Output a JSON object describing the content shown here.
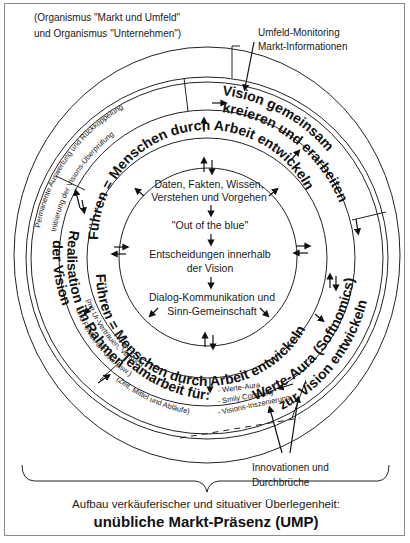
{
  "labels": {
    "top_left_line1": "(Organismus \"Markt und Umfeld\"",
    "top_left_line2": "und Organismus \"Unternehmen\")",
    "top_right_line1": "Umfeld-Monitoring",
    "top_right_line2": "Markt-Informationen",
    "bottom_right_line1": "Innovationen und",
    "bottom_right_line2": "Durchbrüche",
    "footer_line1": "Aufbau verkäuferischer und situativer Überlegenheit:",
    "footer_line2": "unübliche Markt-Präsenz (UMP)"
  },
  "outer_band": {
    "feedback_line1": "Permanente Auswertung und Rückkoppelung",
    "feedback_line2": "Initiierung der Visions-Überprüfung"
  },
  "sectors": {
    "vision_line1": "Vision gemeinsam",
    "vision_line2": "kreieren und erarbeiten",
    "werte_line1": "Werte-Aura (Softnomics)",
    "werte_line2": "zur Vision entwickeln",
    "team_title": "Teamarbeit für:",
    "team_sub": "(Zeit, Mittel und Abläufe)",
    "team_items": [
      "- Werte-Aura",
      "- Smily Company",
      "- Visions-Inszenierung"
    ],
    "realisation_line1": "Realisation im Rahmen",
    "realisation_line2": "der Vision",
    "realisation_sub1": "(mit Ur-Vertrauen, Versuch",
    "realisation_sub2": "und Fehler, OT usw. usw.)"
  },
  "middle_ring": {
    "top": "Führen = Menschen durch Arbeit entwickeln",
    "bottom": "Führen = Menschen durch Arbeit entwickeln"
  },
  "inner_circle": {
    "step1_line1": "Daten, Fakten, Wissen,",
    "step1_line2": "Verstehen und Vorgehen",
    "step2": "\"Out of the blue\"",
    "step3_line1": "Entscheidungen innerhalb",
    "step3_line2": "der Vision",
    "step4_line1": "Dialog-Kommunikation und",
    "step4_line2": "Sinn-Gemeinschaft"
  }
}
